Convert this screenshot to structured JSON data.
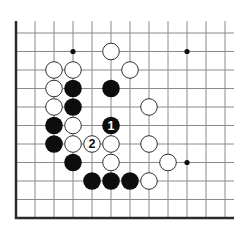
{
  "diagram": {
    "type": "go-board-fragment",
    "colors": {
      "line": "#8a8a8a",
      "edge": "#2a2a2a",
      "black": "#0d0d0d",
      "white": "#ffffff",
      "stone_outline": "#1a1a1a"
    },
    "grid": {
      "cols_x": [
        16,
        35,
        54,
        73,
        92,
        111,
        130,
        149,
        168,
        187,
        206,
        225
      ],
      "rows_y": [
        33,
        51.5,
        70,
        88.5,
        107,
        125.5,
        144,
        162.5,
        181,
        199.5,
        218
      ],
      "top_y": 21,
      "right_x": 234,
      "left_edge": true,
      "bottom_edge": true
    },
    "star_points": [
      {
        "col": 3,
        "row": 1
      },
      {
        "col": 9,
        "row": 1
      },
      {
        "col": 9,
        "row": 7
      }
    ],
    "stones": [
      {
        "color": "white",
        "col": 5,
        "row": 1
      },
      {
        "color": "white",
        "col": 2,
        "row": 2
      },
      {
        "color": "white",
        "col": 3,
        "row": 2
      },
      {
        "color": "white",
        "col": 6,
        "row": 2
      },
      {
        "color": "white",
        "col": 2,
        "row": 3
      },
      {
        "color": "black",
        "col": 3,
        "row": 3
      },
      {
        "color": "black",
        "col": 5,
        "row": 3
      },
      {
        "color": "white",
        "col": 2,
        "row": 4
      },
      {
        "color": "black",
        "col": 3,
        "row": 4
      },
      {
        "color": "white",
        "col": 7,
        "row": 4
      },
      {
        "color": "black",
        "col": 2,
        "row": 5
      },
      {
        "color": "white",
        "col": 3,
        "row": 5
      },
      {
        "color": "black",
        "col": 5,
        "row": 5,
        "label": "1"
      },
      {
        "color": "black",
        "col": 2,
        "row": 6
      },
      {
        "color": "white",
        "col": 3,
        "row": 6
      },
      {
        "color": "white",
        "col": 4,
        "row": 6,
        "label": "2"
      },
      {
        "color": "white",
        "col": 5,
        "row": 6
      },
      {
        "color": "white",
        "col": 7,
        "row": 6
      },
      {
        "color": "black",
        "col": 3,
        "row": 7
      },
      {
        "color": "white",
        "col": 5,
        "row": 7
      },
      {
        "color": "white",
        "col": 8,
        "row": 7
      },
      {
        "color": "black",
        "col": 4,
        "row": 8
      },
      {
        "color": "black",
        "col": 5,
        "row": 8
      },
      {
        "color": "black",
        "col": 6,
        "row": 8
      },
      {
        "color": "white",
        "col": 7,
        "row": 8
      }
    ],
    "move_labels": [
      "1",
      "2"
    ]
  }
}
